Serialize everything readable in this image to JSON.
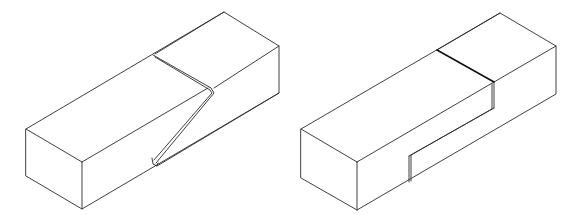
{
  "figure": {
    "stroke_color": "#2a2a2a",
    "background": "#ffffff",
    "items": [
      {
        "id": "left",
        "label": "",
        "joint_type": "angled-scarf",
        "outline": {
          "top_left": [
            26,
            129
          ],
          "front_top": [
            82,
            162
          ],
          "front_bottom": [
            82,
            209
          ],
          "left_bottom": [
            26,
            176
          ],
          "back_top": [
            224,
            12
          ],
          "right_top": [
            279,
            46
          ],
          "right_bottom": [
            279,
            93
          ]
        },
        "cut": {
          "top_start": [
            153,
            55
          ],
          "top_end": [
            212,
            89
          ],
          "diag_end": [
            153,
            158
          ],
          "bottom": [
            155,
            166
          ]
        }
      },
      {
        "id": "right",
        "label": "",
        "joint_type": "stepped-halving",
        "outline": {
          "top_left": [
            301,
            129
          ],
          "front_top": [
            357,
            162
          ],
          "front_bottom": [
            357,
            210
          ],
          "left_bottom": [
            301,
            178
          ],
          "back_top": [
            500,
            13
          ],
          "right_top": [
            556,
            46
          ],
          "right_bottom": [
            556,
            94
          ]
        },
        "cut": {
          "top_start": [
            437,
            50
          ],
          "top_end": [
            494,
            82
          ],
          "step_down": [
            494,
            108
          ],
          "step_end": [
            409,
            156
          ],
          "bottom": [
            409,
            182
          ]
        }
      }
    ]
  }
}
